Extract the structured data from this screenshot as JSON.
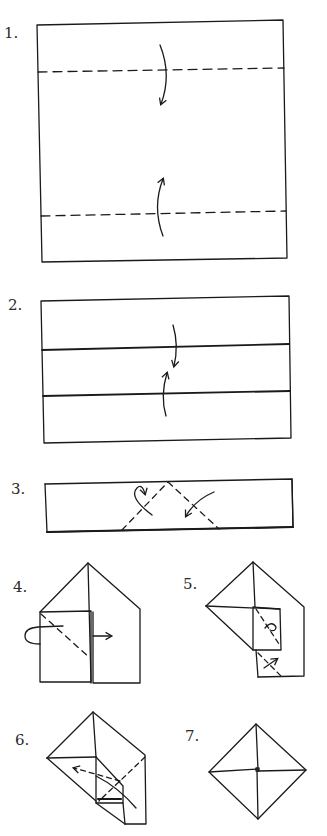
{
  "steps": [
    {
      "label": "1.",
      "description": "Square with two horizontal valley folds; fold top and bottom edges toward center"
    },
    {
      "label": "2.",
      "description": "Folded strips shown with dashed lines; fold edges again toward center"
    },
    {
      "label": "3.",
      "description": "Long strip; fold corners down along dashed diagonals"
    },
    {
      "label": "4.",
      "description": "House shape; fold behind and pull flap to right"
    },
    {
      "label": "5.",
      "description": "Rotated shape with small folds marked"
    },
    {
      "label": "6.",
      "description": "Tuck flap along dashed arrow"
    },
    {
      "label": "7.",
      "description": "Finished diamond (square rotated) with pinwheel creases"
    }
  ],
  "colors": {
    "ink": "#1a1a1a",
    "background": "#ffffff"
  }
}
